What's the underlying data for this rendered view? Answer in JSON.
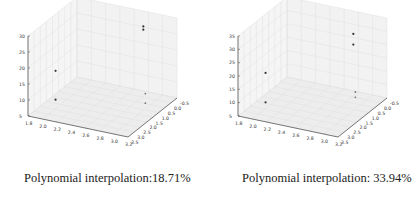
{
  "chart_data": [
    {
      "type": "scatter",
      "projection": "3d",
      "caption": "Polynomial interpolation:18.71%",
      "xlabel": "",
      "ylabel": "",
      "zlabel": "",
      "x_ticks": [
        "1.8",
        "2.0",
        "2.2",
        "2.4",
        "2.6",
        "2.8",
        "3.0",
        "3.2"
      ],
      "y_ticks": [
        "-0.5",
        "0.0",
        "0.5",
        "1.0",
        "1.5",
        "2.0",
        "2.5",
        "3.0",
        "3.5"
      ],
      "z_ticks": [
        "5",
        "10",
        "15",
        "20",
        "25",
        "30"
      ],
      "xlim": [
        1.8,
        3.2
      ],
      "ylim": [
        -0.5,
        3.5
      ],
      "zlim": [
        5,
        30
      ],
      "grid": true,
      "points": [
        {
          "x": 2.1,
          "y": 3.0,
          "z": 19
        },
        {
          "x": 2.1,
          "y": 3.0,
          "z": 10
        },
        {
          "x": 2.9,
          "y": 0.5,
          "z": 29
        },
        {
          "x": 2.9,
          "y": 0.5,
          "z": 28
        },
        {
          "x": 3.1,
          "y": 1.5,
          "z": 12
        },
        {
          "x": 3.1,
          "y": 1.5,
          "z": 9
        }
      ]
    },
    {
      "type": "scatter",
      "projection": "3d",
      "caption": "Polynomial interpolation: 33.94%",
      "xlabel": "",
      "ylabel": "",
      "zlabel": "",
      "x_ticks": [
        "1.8",
        "2.0",
        "2.2",
        "2.4",
        "2.6",
        "2.8",
        "3.0",
        "3.2"
      ],
      "y_ticks": [
        "-0.5",
        "0.0",
        "0.5",
        "1.0",
        "1.5",
        "2.0",
        "2.5",
        "3.0",
        "3.5"
      ],
      "z_ticks": [
        "5",
        "10",
        "15",
        "20",
        "25",
        "30",
        "35"
      ],
      "xlim": [
        1.8,
        3.2
      ],
      "ylim": [
        -0.5,
        3.5
      ],
      "zlim": [
        5,
        35
      ],
      "grid": true,
      "points": [
        {
          "x": 2.1,
          "y": 3.0,
          "z": 21
        },
        {
          "x": 2.1,
          "y": 3.0,
          "z": 10
        },
        {
          "x": 2.9,
          "y": 0.5,
          "z": 31
        },
        {
          "x": 2.9,
          "y": 0.5,
          "z": 27
        },
        {
          "x": 3.1,
          "y": 1.5,
          "z": 14
        },
        {
          "x": 3.1,
          "y": 1.5,
          "z": 12
        }
      ]
    }
  ],
  "captions": [
    "Polynomial interpolation:18.71%",
    "Polynomial interpolation: 33.94%"
  ]
}
